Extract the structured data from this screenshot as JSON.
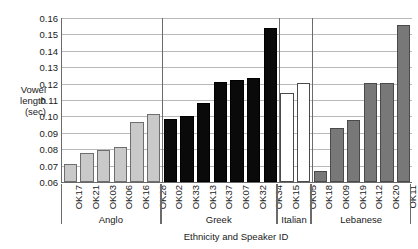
{
  "chart_data": {
    "type": "bar",
    "title": "",
    "xlabel": "Ethnicity and Speaker ID",
    "ylabel": "Vowel length (sec)",
    "ylabel_lines": [
      "Vowel",
      "length",
      "(sec)"
    ],
    "ylim": [
      0.06,
      0.16
    ],
    "ytick_labels": [
      "0.16",
      "0.15",
      "0.14",
      "0.13",
      "0.12",
      "0.11",
      "0.10",
      "0.09",
      "0.08",
      "0.07",
      "0.06"
    ],
    "yticks": [
      0.16,
      0.15,
      0.14,
      0.13,
      0.12,
      0.11,
      0.1,
      0.09,
      0.08,
      0.07,
      0.06
    ],
    "grid": true,
    "legend": "none",
    "categories": [
      "OK17",
      "OK21",
      "OK03",
      "OK06",
      "OK16",
      "OK28",
      "OK02",
      "OK33",
      "OK13",
      "OK37",
      "OK07",
      "OK32",
      "OK34",
      "OK15",
      "OK05",
      "OK18",
      "OK09",
      "OK19",
      "OK12",
      "OK20",
      "OK11"
    ],
    "values": [
      0.071,
      0.0775,
      0.0795,
      0.0812,
      0.0967,
      0.1013,
      0.0982,
      0.1005,
      0.1082,
      0.121,
      0.122,
      0.1235,
      0.154,
      0.1145,
      0.1205,
      0.0665,
      0.0932,
      0.098,
      0.1205,
      0.1205,
      0.1558
    ],
    "groups": [
      {
        "name": "Anglo",
        "fill": "anglo",
        "color": "#c9c9c9",
        "count": 6
      },
      {
        "name": "Greek",
        "fill": "greek",
        "color": "#0a0a0a",
        "count": 7
      },
      {
        "name": "Italian",
        "fill": "italian",
        "color": "#ffffff",
        "count": 2
      },
      {
        "name": "Lebanese",
        "fill": "lebanese",
        "color": "#787878",
        "count": 6
      }
    ]
  }
}
